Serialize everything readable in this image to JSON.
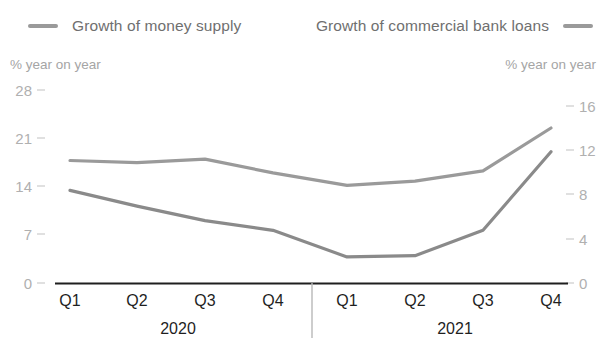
{
  "legend": {
    "left": {
      "label": "Growth of money supply",
      "swatch_color": "#9a9a9a"
    },
    "right": {
      "label": "Growth of commercial bank loans",
      "swatch_color": "#9a9a9a"
    }
  },
  "axes": {
    "left_caption": "% year on year",
    "right_caption": "% year on year",
    "left_ticks": [
      "28",
      "21",
      "14",
      "7",
      "0"
    ],
    "right_ticks": [
      "16",
      "12",
      "8",
      "4",
      "0"
    ]
  },
  "x_labels": [
    "Q1",
    "Q2",
    "Q3",
    "Q4",
    "Q1",
    "Q2",
    "Q3",
    "Q4"
  ],
  "year_labels": [
    "2020",
    "2021"
  ],
  "colors": {
    "money_supply_line": "#9a9a9a",
    "bank_loans_line": "#8a8a8a",
    "baseline": "#1f1f1f",
    "divider": "#b8b8b8"
  },
  "chart_data": {
    "type": "line",
    "title": "",
    "xlabel": "",
    "ylabel": "% year on year",
    "categories": [
      "Q1 2020",
      "Q2 2020",
      "Q3 2020",
      "Q4 2020",
      "Q1 2021",
      "Q2 2021",
      "Q3 2021",
      "Q4 2021"
    ],
    "x_tick_labels": [
      "Q1",
      "Q2",
      "Q3",
      "Q4",
      "Q1",
      "Q2",
      "Q3",
      "Q4"
    ],
    "group_labels": [
      "2020",
      "2021"
    ],
    "grid": false,
    "legend_position": "top",
    "series": [
      {
        "name": "Growth of money supply",
        "axis": "left",
        "ylabel": "% year on year",
        "ylim": [
          0,
          28
        ],
        "yticks": [
          0,
          7,
          14,
          21,
          28
        ],
        "values": [
          17.8,
          17.5,
          18.0,
          16.0,
          14.2,
          14.8,
          16.3,
          22.5
        ],
        "color": "#9a9a9a"
      },
      {
        "name": "Growth of commercial bank loans",
        "axis": "right",
        "ylabel": "% year on year",
        "ylim": [
          0,
          16
        ],
        "yticks": [
          0,
          4,
          8,
          12,
          16
        ],
        "values": [
          7.7,
          6.4,
          5.2,
          4.4,
          2.2,
          2.3,
          4.4,
          10.9
        ],
        "color": "#8a8a8a"
      }
    ]
  }
}
